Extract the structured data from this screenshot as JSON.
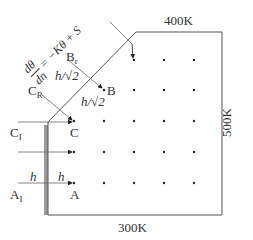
{
  "diagram": {
    "boundary_labels": {
      "top": "400K",
      "right": "500K",
      "bottom": "300K"
    },
    "equation": {
      "lhs_num": "dθ",
      "lhs_den": "dn",
      "rhs": "= −Kθ + S"
    },
    "node_labels": {
      "A": "A",
      "A_image": "A",
      "A_image_sub": "I",
      "B": "B",
      "B_reflect": "B",
      "B_reflect_sub": "r",
      "C": "C",
      "C_image": "C",
      "C_image_sub": "I",
      "C_reflect": "C",
      "C_reflect_sub": "R"
    },
    "spacing_labels": {
      "h1": "h",
      "h2": "h",
      "h_over_root2_a": "h/√2",
      "h_over_root2_b": "h/√2"
    },
    "colors": {
      "line": "#555555",
      "dot": "#222222",
      "shadow": "#9a9a9a"
    }
  }
}
